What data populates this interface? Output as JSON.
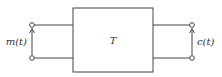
{
  "diagram": {
    "block_label": "T",
    "input_label": "m(t)",
    "output_label": "c(t)",
    "colors": {
      "stroke": "#444444",
      "text": "#333333",
      "background": "#ffffff"
    }
  }
}
